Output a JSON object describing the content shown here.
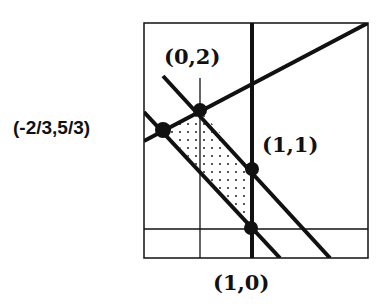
{
  "diagram": {
    "type": "feasible-region-plot",
    "vertices": [
      {
        "label": "(0,2)",
        "x": 0,
        "y": 2
      },
      {
        "label": "(-2/3,5/3)",
        "x": -0.6667,
        "y": 1.6667
      },
      {
        "label": "(1,1)",
        "x": 1,
        "y": 1
      },
      {
        "label": "(1,0)",
        "x": 1,
        "y": 0
      }
    ],
    "lines": [
      {
        "name": "y = x/2 + 2",
        "weight": "thick"
      },
      {
        "name": "y = -x + 2",
        "weight": "thick"
      },
      {
        "name": "y = -x + 1",
        "weight": "thick"
      },
      {
        "name": "x = 1",
        "weight": "thick"
      },
      {
        "name": "x = 0 (axis)",
        "weight": "thin"
      },
      {
        "name": "y = 0 (axis)",
        "weight": "thin"
      }
    ],
    "shaded_region": "dotted",
    "labels": {
      "v_0_2": "(0,2)",
      "v_m23_53": "(-2/3,5/3)",
      "v_1_1": "(1,1)",
      "v_1_0": "(1,0)"
    }
  }
}
